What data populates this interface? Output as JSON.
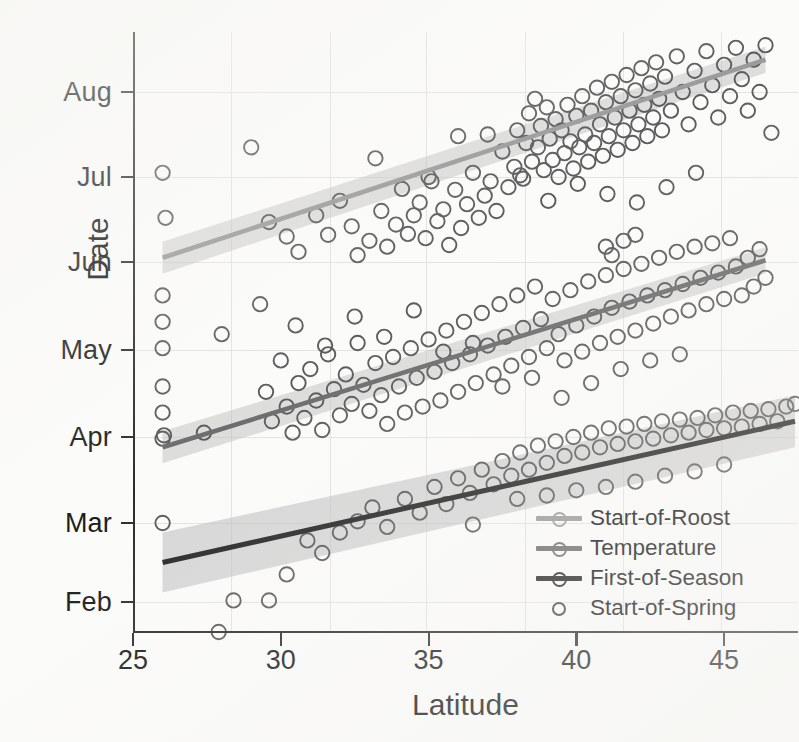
{
  "chart_data": {
    "type": "scatter",
    "title": "",
    "xlabel": "Latitude",
    "ylabel": "Date",
    "xlim": [
      25,
      47.5
    ],
    "ylim_labels": [
      "Feb",
      "Mar",
      "Apr",
      "May",
      "Jun",
      "Jul",
      "Aug"
    ],
    "xticks": [
      25,
      30,
      35,
      40,
      45
    ],
    "yticks": [
      "Feb",
      "Mar",
      "Apr",
      "May",
      "Jun",
      "Jul",
      "Aug"
    ],
    "grid": true,
    "legend_position": "bottom-right",
    "series": [
      {
        "name": "Start-of-Roost",
        "color": "#9a9a9a",
        "marker": "open-circle",
        "has_fit_line": true,
        "has_confidence_band": true,
        "fit": {
          "x0": 26.0,
          "y0_month": 6.05,
          "x1": 46.4,
          "y1_month": 8.38
        },
        "points": [
          [
            26.0,
            7.05
          ],
          [
            26.1,
            6.52
          ],
          [
            29.0,
            7.35
          ],
          [
            29.6,
            6.47
          ],
          [
            30.2,
            6.3
          ],
          [
            30.6,
            6.12
          ],
          [
            31.2,
            6.55
          ],
          [
            31.6,
            6.32
          ],
          [
            32.0,
            6.72
          ],
          [
            32.4,
            6.42
          ],
          [
            32.6,
            6.08
          ],
          [
            33.0,
            6.25
          ],
          [
            33.2,
            7.22
          ],
          [
            33.4,
            6.6
          ],
          [
            33.6,
            6.18
          ],
          [
            33.9,
            6.44
          ],
          [
            34.1,
            6.86
          ],
          [
            34.3,
            6.33
          ],
          [
            34.5,
            6.55
          ],
          [
            34.7,
            6.7
          ],
          [
            34.9,
            6.28
          ],
          [
            35.1,
            6.95
          ],
          [
            35.3,
            6.48
          ],
          [
            35.5,
            6.62
          ],
          [
            35.7,
            6.2
          ],
          [
            35.9,
            6.85
          ],
          [
            36.1,
            6.4
          ],
          [
            36.3,
            6.68
          ],
          [
            36.5,
            7.05
          ],
          [
            36.7,
            6.52
          ],
          [
            36.9,
            6.78
          ],
          [
            37.1,
            6.95
          ],
          [
            37.3,
            6.6
          ],
          [
            37.5,
            7.3
          ],
          [
            37.7,
            6.88
          ],
          [
            37.9,
            7.12
          ],
          [
            38.0,
            7.55
          ],
          [
            38.1,
            7.02
          ],
          [
            38.3,
            7.4
          ],
          [
            38.4,
            7.75
          ],
          [
            38.5,
            7.18
          ],
          [
            38.6,
            7.92
          ],
          [
            38.7,
            7.35
          ],
          [
            38.8,
            7.6
          ],
          [
            38.9,
            7.08
          ],
          [
            39.0,
            7.82
          ],
          [
            39.1,
            7.45
          ],
          [
            39.2,
            7.2
          ],
          [
            39.3,
            7.68
          ],
          [
            39.4,
            7.0
          ],
          [
            39.5,
            7.55
          ],
          [
            39.6,
            7.28
          ],
          [
            39.7,
            7.85
          ],
          [
            39.8,
            7.42
          ],
          [
            39.9,
            7.1
          ],
          [
            40.0,
            7.72
          ],
          [
            40.1,
            7.35
          ],
          [
            40.2,
            7.95
          ],
          [
            40.3,
            7.5
          ],
          [
            40.4,
            7.18
          ],
          [
            40.5,
            7.78
          ],
          [
            40.6,
            7.4
          ],
          [
            40.7,
            8.05
          ],
          [
            40.8,
            7.62
          ],
          [
            40.9,
            7.25
          ],
          [
            41.0,
            7.88
          ],
          [
            41.1,
            7.48
          ],
          [
            41.2,
            8.12
          ],
          [
            41.3,
            7.7
          ],
          [
            41.4,
            7.32
          ],
          [
            41.5,
            7.95
          ],
          [
            41.6,
            7.55
          ],
          [
            41.7,
            8.2
          ],
          [
            41.8,
            7.78
          ],
          [
            41.9,
            7.4
          ],
          [
            42.0,
            8.02
          ],
          [
            42.1,
            7.62
          ],
          [
            42.2,
            8.28
          ],
          [
            42.3,
            7.85
          ],
          [
            42.4,
            7.48
          ],
          [
            42.5,
            8.1
          ],
          [
            42.6,
            7.7
          ],
          [
            42.7,
            8.35
          ],
          [
            42.8,
            7.92
          ],
          [
            42.9,
            7.55
          ],
          [
            43.0,
            8.18
          ],
          [
            43.2,
            7.78
          ],
          [
            43.4,
            8.42
          ],
          [
            43.6,
            8.0
          ],
          [
            43.8,
            7.62
          ],
          [
            44.0,
            8.25
          ],
          [
            44.2,
            7.88
          ],
          [
            44.4,
            8.48
          ],
          [
            44.6,
            8.08
          ],
          [
            44.8,
            7.7
          ],
          [
            45.0,
            8.32
          ],
          [
            45.2,
            7.95
          ],
          [
            45.4,
            8.52
          ],
          [
            45.6,
            8.15
          ],
          [
            45.8,
            7.78
          ],
          [
            46.0,
            8.38
          ],
          [
            46.2,
            8.0
          ],
          [
            46.4,
            8.55
          ],
          [
            46.6,
            7.52
          ],
          [
            36.0,
            7.48
          ],
          [
            37.0,
            7.5
          ],
          [
            38.2,
            6.98
          ],
          [
            39.05,
            6.72
          ],
          [
            40.05,
            6.92
          ],
          [
            41.05,
            6.8
          ],
          [
            42.05,
            6.7
          ],
          [
            43.05,
            6.88
          ],
          [
            44.05,
            7.05
          ],
          [
            35.0,
            7.0
          ]
        ]
      },
      {
        "name": "Temperature",
        "color": "#6d6d6d",
        "marker": "open-circle",
        "has_fit_line": true,
        "has_confidence_band": true,
        "fit": {
          "x0": 26.0,
          "y0_month": 3.88,
          "x1": 46.4,
          "y1_month": 6.02
        },
        "points": [
          [
            26.0,
            5.62
          ],
          [
            26.0,
            5.32
          ],
          [
            26.0,
            5.02
          ],
          [
            26.0,
            4.58
          ],
          [
            26.0,
            4.28
          ],
          [
            26.0,
            3.98
          ],
          [
            26.05,
            4.02
          ],
          [
            27.4,
            4.05
          ],
          [
            28.0,
            5.18
          ],
          [
            29.3,
            5.52
          ],
          [
            29.5,
            4.52
          ],
          [
            29.7,
            4.18
          ],
          [
            30.0,
            4.88
          ],
          [
            30.2,
            4.35
          ],
          [
            30.4,
            4.05
          ],
          [
            30.6,
            4.62
          ],
          [
            30.8,
            4.22
          ],
          [
            31.0,
            4.78
          ],
          [
            31.2,
            4.42
          ],
          [
            31.4,
            4.08
          ],
          [
            31.6,
            4.95
          ],
          [
            31.8,
            4.55
          ],
          [
            32.0,
            4.25
          ],
          [
            32.2,
            4.72
          ],
          [
            32.4,
            4.38
          ],
          [
            32.6,
            5.08
          ],
          [
            32.8,
            4.6
          ],
          [
            33.0,
            4.3
          ],
          [
            33.2,
            4.85
          ],
          [
            33.4,
            4.48
          ],
          [
            33.6,
            4.15
          ],
          [
            33.8,
            4.92
          ],
          [
            34.0,
            4.58
          ],
          [
            34.2,
            4.28
          ],
          [
            34.4,
            5.02
          ],
          [
            34.6,
            4.68
          ],
          [
            34.8,
            4.35
          ],
          [
            35.0,
            5.12
          ],
          [
            35.2,
            4.75
          ],
          [
            35.4,
            4.42
          ],
          [
            35.6,
            5.22
          ],
          [
            35.8,
            4.85
          ],
          [
            36.0,
            4.52
          ],
          [
            36.2,
            5.32
          ],
          [
            36.4,
            4.95
          ],
          [
            36.6,
            4.62
          ],
          [
            36.8,
            5.42
          ],
          [
            37.0,
            5.05
          ],
          [
            37.2,
            4.72
          ],
          [
            37.4,
            5.52
          ],
          [
            37.6,
            5.15
          ],
          [
            37.8,
            4.82
          ],
          [
            38.0,
            5.62
          ],
          [
            38.2,
            5.25
          ],
          [
            38.4,
            4.92
          ],
          [
            38.6,
            5.72
          ],
          [
            38.8,
            5.35
          ],
          [
            39.0,
            5.02
          ],
          [
            39.2,
            5.58
          ],
          [
            39.4,
            5.18
          ],
          [
            39.6,
            4.88
          ],
          [
            39.8,
            5.68
          ],
          [
            40.0,
            5.28
          ],
          [
            40.2,
            4.98
          ],
          [
            40.4,
            5.78
          ],
          [
            40.6,
            5.38
          ],
          [
            40.8,
            5.08
          ],
          [
            41.0,
            5.85
          ],
          [
            41.2,
            5.48
          ],
          [
            41.4,
            5.15
          ],
          [
            41.6,
            5.92
          ],
          [
            41.8,
            5.55
          ],
          [
            42.0,
            5.22
          ],
          [
            42.2,
            5.98
          ],
          [
            42.4,
            5.62
          ],
          [
            42.6,
            5.3
          ],
          [
            42.8,
            6.05
          ],
          [
            43.0,
            5.68
          ],
          [
            43.2,
            5.38
          ],
          [
            43.4,
            6.12
          ],
          [
            43.6,
            5.75
          ],
          [
            43.8,
            5.45
          ],
          [
            44.0,
            6.18
          ],
          [
            44.2,
            5.82
          ],
          [
            44.4,
            5.52
          ],
          [
            44.6,
            6.22
          ],
          [
            44.8,
            5.88
          ],
          [
            45.0,
            5.58
          ],
          [
            45.2,
            6.28
          ],
          [
            45.4,
            5.95
          ],
          [
            45.6,
            5.62
          ],
          [
            45.8,
            6.05
          ],
          [
            46.0,
            5.72
          ],
          [
            46.2,
            6.15
          ],
          [
            46.4,
            5.82
          ],
          [
            30.5,
            5.28
          ],
          [
            31.5,
            5.05
          ],
          [
            32.5,
            5.38
          ],
          [
            33.5,
            5.15
          ],
          [
            34.5,
            5.45
          ],
          [
            35.5,
            4.98
          ],
          [
            36.5,
            5.08
          ],
          [
            37.5,
            4.58
          ],
          [
            38.5,
            4.68
          ],
          [
            39.5,
            4.45
          ],
          [
            40.5,
            4.62
          ],
          [
            41.5,
            4.78
          ],
          [
            42.5,
            4.88
          ],
          [
            43.5,
            4.95
          ],
          [
            41.2,
            6.08
          ],
          [
            41.6,
            6.25
          ],
          [
            42.0,
            6.32
          ],
          [
            41.0,
            6.18
          ]
        ]
      },
      {
        "name": "First-of-Season",
        "color": "#262626",
        "marker": "open-circle",
        "has_fit_line": true,
        "has_confidence_band": true,
        "fit": {
          "x0": 26.0,
          "y0_month": 2.5,
          "x1": 47.4,
          "y1_month": 4.18
        },
        "points": [
          [
            26.0,
            3.0
          ],
          [
            27.9,
            1.62
          ],
          [
            28.4,
            2.02
          ],
          [
            29.6,
            2.02
          ],
          [
            30.2,
            2.35
          ],
          [
            30.9,
            2.78
          ],
          [
            31.4,
            2.62
          ],
          [
            32.0,
            2.88
          ],
          [
            32.6,
            3.02
          ],
          [
            33.1,
            3.18
          ],
          [
            33.6,
            2.95
          ],
          [
            34.2,
            3.28
          ],
          [
            34.7,
            3.12
          ],
          [
            35.2,
            3.42
          ],
          [
            35.6,
            3.22
          ],
          [
            36.0,
            3.52
          ],
          [
            36.4,
            3.35
          ],
          [
            36.8,
            3.62
          ],
          [
            37.2,
            3.45
          ],
          [
            37.5,
            3.72
          ],
          [
            37.8,
            3.55
          ],
          [
            38.1,
            3.82
          ],
          [
            38.4,
            3.62
          ],
          [
            38.7,
            3.9
          ],
          [
            39.0,
            3.7
          ],
          [
            39.3,
            3.95
          ],
          [
            39.6,
            3.78
          ],
          [
            39.9,
            4.0
          ],
          [
            40.2,
            3.82
          ],
          [
            40.5,
            4.05
          ],
          [
            40.8,
            3.88
          ],
          [
            41.1,
            4.1
          ],
          [
            41.4,
            3.92
          ],
          [
            41.7,
            4.12
          ],
          [
            42.0,
            3.95
          ],
          [
            42.3,
            4.15
          ],
          [
            42.6,
            3.98
          ],
          [
            42.9,
            4.18
          ],
          [
            43.2,
            4.02
          ],
          [
            43.5,
            4.2
          ],
          [
            43.8,
            4.05
          ],
          [
            44.1,
            4.22
          ],
          [
            44.4,
            4.08
          ],
          [
            44.7,
            4.25
          ],
          [
            45.0,
            4.1
          ],
          [
            45.3,
            4.28
          ],
          [
            45.6,
            4.12
          ],
          [
            45.9,
            4.3
          ],
          [
            46.2,
            4.15
          ],
          [
            46.5,
            4.32
          ],
          [
            46.8,
            4.18
          ],
          [
            47.1,
            4.35
          ],
          [
            47.4,
            4.38
          ],
          [
            38.0,
            3.28
          ],
          [
            39.0,
            3.32
          ],
          [
            40.0,
            3.38
          ],
          [
            41.0,
            3.42
          ],
          [
            42.0,
            3.48
          ],
          [
            43.0,
            3.55
          ],
          [
            44.0,
            3.6
          ],
          [
            45.0,
            3.68
          ],
          [
            36.5,
            2.98
          ]
        ]
      },
      {
        "name": "Start-of-Spring",
        "color": "#555555",
        "marker": "open-circle",
        "has_fit_line": false,
        "has_confidence_band": false,
        "note": "open circle marker only; no fitted line shown"
      }
    ]
  },
  "legend": {
    "items": [
      {
        "label": "Start-of-Roost",
        "color": "#9a9a9a",
        "style": "line-with-circle"
      },
      {
        "label": "Temperature",
        "color": "#6d6d6d",
        "style": "line-with-circle"
      },
      {
        "label": "First-of-Season",
        "color": "#262626",
        "style": "line-with-circle"
      },
      {
        "label": "Start-of-Spring",
        "color": "#444444",
        "style": "circle-only"
      }
    ]
  },
  "axes": {
    "x_title": "Latitude",
    "y_title": "Date",
    "x_ticks": [
      "25",
      "30",
      "35",
      "40",
      "45"
    ],
    "y_ticks": [
      "Aug",
      "Jul",
      "Jun",
      "May",
      "Apr",
      "Mar",
      "Feb"
    ]
  }
}
